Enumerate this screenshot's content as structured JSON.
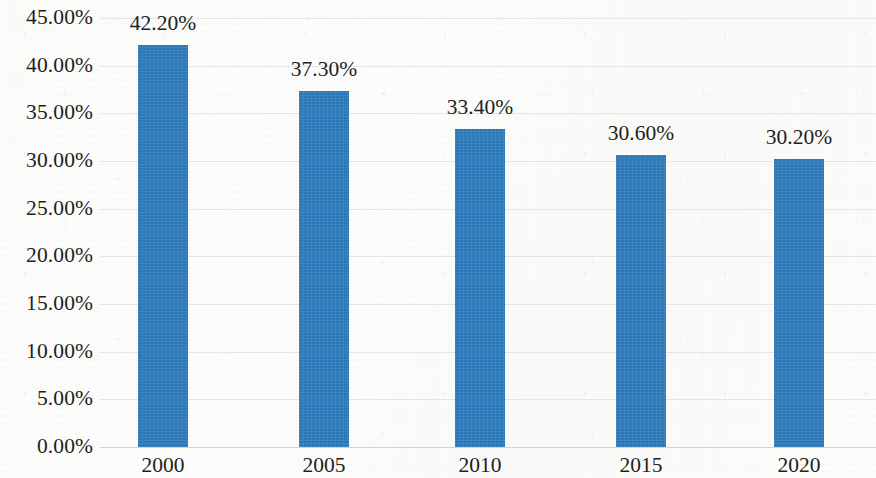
{
  "chart_data": {
    "type": "bar",
    "title": "",
    "subtitle": "",
    "xlabel": "",
    "ylabel": "",
    "categories": [
      "2000",
      "2005",
      "2010",
      "2015",
      "2020"
    ],
    "values": [
      42.2,
      37.3,
      33.4,
      30.6,
      30.2
    ],
    "data_labels": [
      "42.20%",
      "37.30%",
      "33.40%",
      "30.60%",
      "30.20%"
    ],
    "ylim": [
      0,
      45
    ],
    "ytick_values": [
      0,
      5,
      10,
      15,
      20,
      25,
      30,
      35,
      40,
      45
    ],
    "ytick_labels": [
      "0.00%",
      "5.00%",
      "10.00%",
      "15.00%",
      "20.00%",
      "25.00%",
      "30.00%",
      "35.00%",
      "40.00%",
      "45.00%"
    ],
    "grid": true,
    "legend": false,
    "legend_position": "none",
    "series": [
      {
        "name": "",
        "values": [
          42.2,
          37.3,
          33.4,
          30.6,
          30.2
        ],
        "color": "#2a78b8"
      }
    ],
    "colors": {
      "bar": "#2a78b8",
      "gridline": "#e3e5e6",
      "axis": "#cfd3d4",
      "text": "#231f20",
      "background": "#fdfdfc"
    }
  }
}
